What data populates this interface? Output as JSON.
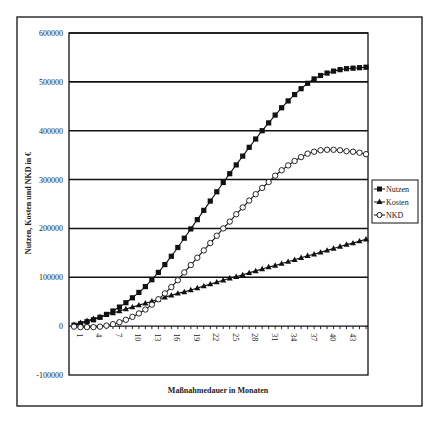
{
  "chart_data": {
    "type": "line",
    "title": "",
    "xlabel": "Maßnahmedauer in Monaten",
    "ylabel": "Nutzen, Kosten und NKD in €",
    "ylim": [
      -100000,
      600000
    ],
    "yticks": [
      600000,
      500000,
      400000,
      300000,
      200000,
      100000,
      0,
      -100000
    ],
    "ytick_labels": [
      "600000",
      "500000",
      "400000",
      "300000",
      "200000",
      "100000",
      "0",
      "-100000"
    ],
    "xtick_labels": [
      "1",
      "4",
      "7",
      "10",
      "13",
      "16",
      "19",
      "22",
      "25",
      "28",
      "31",
      "34",
      "37",
      "40",
      "43"
    ],
    "grid": "horizontal",
    "legend_position": "right",
    "x": [
      1,
      2,
      3,
      4,
      5,
      6,
      7,
      8,
      9,
      10,
      11,
      12,
      13,
      14,
      15,
      16,
      17,
      18,
      19,
      20,
      21,
      22,
      23,
      24,
      25,
      26,
      27,
      28,
      29,
      30,
      31,
      32,
      33,
      34,
      35,
      36,
      37,
      38,
      39,
      40,
      41,
      42,
      43,
      44,
      45,
      46
    ],
    "series": [
      {
        "name": "Nutzen",
        "marker": "filled-square",
        "values": [
          2000,
          5000,
          9000,
          13000,
          18000,
          24000,
          31000,
          39000,
          48000,
          58000,
          69000,
          81000,
          95000,
          110000,
          126000,
          143000,
          161000,
          180000,
          199000,
          218000,
          237000,
          256000,
          275000,
          294000,
          312000,
          330000,
          348000,
          366000,
          383000,
          400000,
          416000,
          432000,
          447000,
          461000,
          474000,
          486000,
          497000,
          506000,
          513000,
          518000,
          522000,
          525000,
          527000,
          528000,
          529000,
          530000
        ]
      },
      {
        "name": "Kosten",
        "marker": "filled-triangle",
        "values": [
          3000,
          7000,
          11000,
          15000,
          19000,
          23000,
          27000,
          31000,
          35000,
          39000,
          43000,
          47000,
          51000,
          55000,
          59000,
          63000,
          67000,
          70000,
          74000,
          78000,
          82000,
          86000,
          90000,
          94000,
          98000,
          101000,
          105000,
          109000,
          113000,
          117000,
          121000,
          124000,
          128000,
          132000,
          136000,
          140000,
          144000,
          147000,
          151000,
          155000,
          159000,
          163000,
          167000,
          170000,
          174000,
          178000
        ]
      },
      {
        "name": "NKD",
        "marker": "open-circle",
        "values": [
          -1000,
          -2000,
          -2000,
          -2000,
          -1000,
          1000,
          4000,
          8000,
          13000,
          19000,
          26000,
          34000,
          44000,
          55000,
          67000,
          80000,
          94000,
          110000,
          125000,
          140000,
          155000,
          170000,
          185000,
          200000,
          214000,
          229000,
          243000,
          257000,
          270000,
          283000,
          295000,
          308000,
          319000,
          329000,
          338000,
          346000,
          353000,
          357000,
          360000,
          361000,
          361000,
          360000,
          358000,
          357000,
          355000,
          352000
        ]
      }
    ]
  },
  "legend": {
    "items": [
      {
        "label": "Nutzen"
      },
      {
        "label": "Kosten"
      },
      {
        "label": "NKD"
      }
    ]
  },
  "axes": {
    "xlabel": "Maßnahmedauer in Monaten",
    "ylabel": "Nutzen, Kosten und NKD in €"
  }
}
